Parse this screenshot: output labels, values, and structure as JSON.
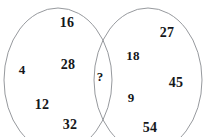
{
  "figure": {
    "kind": "venn-diagram",
    "width": 207,
    "height": 137,
    "background_color": "#ffffff",
    "stroke_color": "#8a8d92",
    "text_color": "#15171a",
    "stroke_width": 0.9
  },
  "sets": {
    "left": {
      "name": "left-set",
      "center_x": 58,
      "center_y": 80,
      "radius_x": 54,
      "radius_y": 72
    },
    "right": {
      "name": "right-set",
      "center_x": 148,
      "center_y": 80,
      "radius_x": 54,
      "radius_y": 72
    }
  },
  "left_only": {
    "values": [
      "16",
      "4",
      "28",
      "12",
      "32"
    ],
    "positions": [
      {
        "x": 67,
        "y": 23
      },
      {
        "x": 22,
        "y": 69
      },
      {
        "x": 68,
        "y": 65
      },
      {
        "x": 42,
        "y": 105
      },
      {
        "x": 70,
        "y": 125
      }
    ]
  },
  "intersection": {
    "values": [
      "?"
    ],
    "positions": [
      {
        "x": 100,
        "y": 76
      }
    ]
  },
  "right_only": {
    "values": [
      "27",
      "18",
      "45",
      "9",
      "54"
    ],
    "positions": [
      {
        "x": 167,
        "y": 33
      },
      {
        "x": 133,
        "y": 55
      },
      {
        "x": 176,
        "y": 83
      },
      {
        "x": 131,
        "y": 97
      },
      {
        "x": 150,
        "y": 128
      }
    ]
  }
}
